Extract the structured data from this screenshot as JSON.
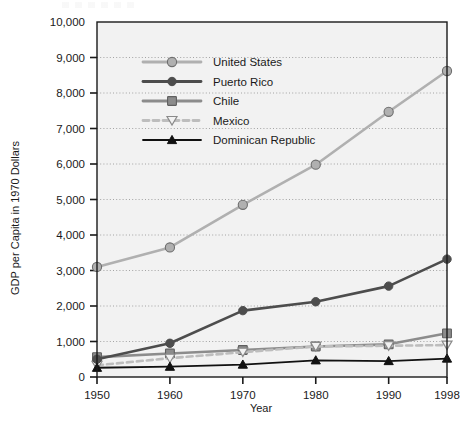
{
  "chart_data": {
    "type": "line",
    "title": "",
    "xlabel": "Year",
    "ylabel": "GDP per Capita in 1970 Dollars",
    "categories": [
      "1950",
      "1960",
      "1970",
      "1980",
      "1990",
      "1998"
    ],
    "x": [
      1950,
      1960,
      1970,
      1980,
      1990,
      1998
    ],
    "xlim": [
      1950,
      1998
    ],
    "ylim": [
      0,
      10000
    ],
    "ytick_labels": [
      "0",
      "1,000",
      "2,000",
      "3,000",
      "4,000",
      "5,000",
      "6,000",
      "7,000",
      "8,000",
      "9,000",
      "10,000"
    ],
    "ytick_values": [
      0,
      1000,
      2000,
      3000,
      4000,
      5000,
      6000,
      7000,
      8000,
      9000,
      10000
    ],
    "grid": "horizontal-dotted",
    "legend_position": "upper-left-inside",
    "series": [
      {
        "name": "United States",
        "color": "#b0b0b0",
        "marker": "circle",
        "dash": "solid",
        "values": [
          3100,
          3650,
          4850,
          5980,
          7470,
          8620
        ]
      },
      {
        "name": "Puerto Rico",
        "color": "#4d4d4d",
        "marker": "circle-filled",
        "dash": "solid",
        "values": [
          500,
          950,
          1870,
          2120,
          2560,
          3320
        ]
      },
      {
        "name": "Chile",
        "color": "#8c8c8c",
        "marker": "square",
        "dash": "solid",
        "values": [
          560,
          660,
          760,
          860,
          920,
          1230
        ]
      },
      {
        "name": "Mexico",
        "color": "#bdbdbd",
        "marker": "triangle-down-open",
        "dash": "dashed",
        "values": [
          330,
          530,
          700,
          860,
          880,
          900
        ]
      },
      {
        "name": "Dominican Republic",
        "color": "#111111",
        "marker": "triangle-up-filled",
        "dash": "solid",
        "values": [
          260,
          290,
          350,
          470,
          450,
          520
        ]
      }
    ]
  },
  "axes": {
    "y_title": "GDP per Capita in 1970 Dollars",
    "x_title": "Year",
    "y_labels": [
      "10,000",
      "9,000",
      "8,000",
      "7,000",
      "6,000",
      "5,000",
      "4,000",
      "3,000",
      "2,000",
      "1,000",
      "0"
    ],
    "x_labels": [
      "1950",
      "1960",
      "1970",
      "1980",
      "1990",
      "1998"
    ]
  },
  "legend": {
    "items": [
      {
        "label": "United States"
      },
      {
        "label": "Puerto Rico"
      },
      {
        "label": "Chile"
      },
      {
        "label": "Mexico"
      },
      {
        "label": "Dominican Republic"
      }
    ]
  },
  "colors": {
    "united_states": "#b0b0b0",
    "puerto_rico": "#4d4d4d",
    "chile": "#8c8c8c",
    "mexico": "#bdbdbd",
    "dominican_republic": "#111111",
    "plot_background": "#f2f2f2",
    "axis": "#1a1a1a",
    "grid": "#9a9a9a"
  }
}
